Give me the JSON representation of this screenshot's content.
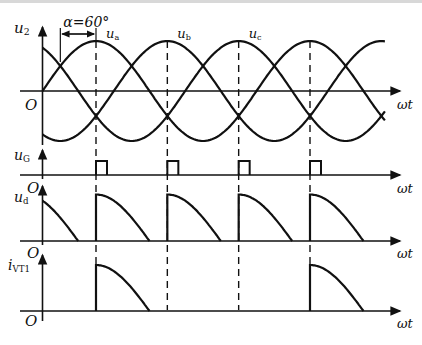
{
  "figure": {
    "alpha_label": "α=60°",
    "alpha_deg": 60,
    "panels": [
      {
        "id": "u2",
        "y_label": "u",
        "y_sub": "2",
        "x_label": "ωt",
        "origin_label": "O",
        "phase_labels": [
          {
            "main": "u",
            "sub": "a"
          },
          {
            "main": "u",
            "sub": "b"
          },
          {
            "main": "u",
            "sub": "c"
          }
        ]
      },
      {
        "id": "uG",
        "y_label": "u",
        "y_sub": "G",
        "x_label": "ωt",
        "origin_label": "O"
      },
      {
        "id": "ud",
        "y_label": "u",
        "y_sub": "d",
        "x_label": "ωt",
        "origin_label": "O"
      },
      {
        "id": "iVT1",
        "y_label": "i",
        "y_sub": "VT1",
        "x_label": "ωt",
        "origin_label": "O"
      }
    ]
  },
  "chart_data": {
    "type": "line",
    "title": "",
    "annotations": [
      "α=60°",
      "ua",
      "ub",
      "uc"
    ],
    "x_unit": "ωt (degrees)",
    "x_range_deg": [
      0,
      640
    ],
    "series": [
      {
        "name": "ua",
        "formula": "sin(ωt)",
        "panel": "u2"
      },
      {
        "name": "ub",
        "formula": "sin(ωt-120°)",
        "panel": "u2"
      },
      {
        "name": "uc",
        "formula": "sin(ωt+120°)",
        "panel": "u2"
      },
      {
        "name": "uG",
        "panel": "uG",
        "pulse_positions_deg": [
          90,
          210,
          330,
          450
        ]
      },
      {
        "name": "ud",
        "panel": "ud",
        "segments_deg": [
          [
            0,
            60
          ],
          [
            90,
            180
          ],
          [
            210,
            300
          ],
          [
            330,
            420
          ],
          [
            450,
            540
          ]
        ]
      },
      {
        "name": "iVT1",
        "panel": "iVT1",
        "segments_deg": [
          [
            90,
            180
          ],
          [
            450,
            540
          ]
        ]
      }
    ],
    "dashed_lines_deg": [
      90,
      210,
      330,
      450
    ],
    "grid": false,
    "legend": "none"
  }
}
